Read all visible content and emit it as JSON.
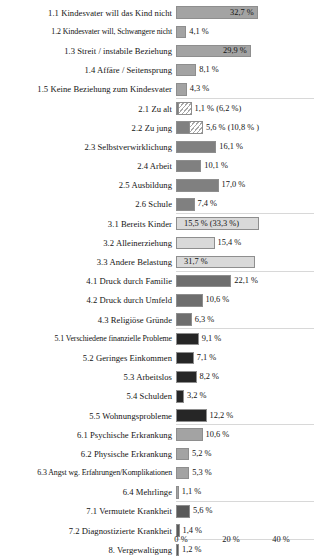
{
  "chart_data": {
    "type": "bar",
    "orientation": "horizontal",
    "title": "",
    "subtitle": "",
    "xlabel": "",
    "ylabel": "",
    "xlim": [
      0,
      44
    ],
    "grid": false,
    "legend": null,
    "axis": {
      "ticks": [
        {
          "value": 0,
          "label": "0 %"
        },
        {
          "value": 20,
          "label": "20 %"
        },
        {
          "value": 40,
          "label": "40 %"
        }
      ],
      "unit": "%"
    },
    "note": "Bars 2.1 and 2.2 show a solid primary value plus a hatched extension; value labels in parentheses give the extended total. Bar 3.1 shows the extended total 33,3 % as the drawn bar length.",
    "categories": [
      "1.1 Kindesvater will das Kind nicht",
      "1.2 Kindesvater will, Schwangere nicht",
      "1.3 Streit / instabile Beziehung",
      "1.4 Affäre / Seitensprung",
      "1.5 Keine Beziehung zum Kindesvater",
      "2.1 Zu alt",
      "2.2 Zu jung",
      "2.3 Selbstverwirklichung",
      "2.4 Arbeit",
      "2.5 Ausbildung",
      "2.6 Schule",
      "3.1 Bereits Kinder",
      "3.2 Alleinerziehung",
      "3.3 Andere Belastung",
      "4.1 Druck durch Familie",
      "4.2 Druck durch Umfeld",
      "4.3 Religiöse Gründe",
      "5.1 Verschiedene finanzielle Probleme",
      "5.2 Geringes Einkommen",
      "5.3 Arbeitslos",
      "5.4 Schulden",
      "5.5 Wohnungsprobleme",
      "6.1 Psychische Erkrankung",
      "6.2 Physische Erkrankung",
      "6.3 Angst wg. Erfahrungen/Komplikationen",
      "6.4 Mehrlinge",
      "7.1 Vermutete Krankheit",
      "7.2 Diagnostizierte Krankheit",
      "8. Vergewaltigung"
    ],
    "values": [
      32.7,
      4.1,
      29.9,
      8.1,
      4.3,
      1.1,
      5.6,
      16.1,
      10.1,
      17.0,
      7.4,
      15.5,
      15.4,
      31.7,
      22.1,
      10.6,
      6.3,
      9.1,
      7.1,
      8.2,
      3.2,
      12.2,
      10.6,
      5.2,
      5.3,
      1.1,
      5.6,
      1.4,
      1.2
    ],
    "values_extended": [
      null,
      null,
      null,
      null,
      null,
      6.2,
      10.8,
      null,
      null,
      null,
      null,
      33.3,
      null,
      null,
      null,
      null,
      null,
      null,
      null,
      null,
      null,
      null,
      null,
      null,
      null,
      null,
      null,
      null,
      null
    ]
  },
  "colors": {
    "group1": "#a3a3a3",
    "group2": "#808080",
    "group3": "#d9d9d9",
    "group4": "#6e6e6e",
    "group5": "#262626",
    "group6": "#a3a3a3",
    "group7": "#595959",
    "group8": "#595959",
    "hatch_line": "#a8a8a8",
    "bar_border": "#8e8e8e",
    "separator": "#d8d8d8",
    "text": "#141414",
    "background": "#ffffff"
  },
  "rows": [
    {
      "label": "1.1 Kindesvater will das Kind nicht",
      "value": 32.7,
      "value_label": "32,7 %",
      "color_key": "group1",
      "label_inside": true,
      "hatch_to": null,
      "tiny": false
    },
    {
      "label": "1.2 Kindesvater will, Schwangere nicht",
      "value": 4.1,
      "value_label": "4,1 %",
      "color_key": "group1",
      "label_inside": false,
      "hatch_to": null,
      "tiny": true
    },
    {
      "label": "1.3 Streit / instabile Beziehung",
      "value": 29.9,
      "value_label": "29,9 %",
      "color_key": "group1",
      "label_inside": true,
      "hatch_to": null,
      "tiny": false
    },
    {
      "label": "1.4 Affäre / Seitensprung",
      "value": 8.1,
      "value_label": "8,1 %",
      "color_key": "group1",
      "label_inside": false,
      "hatch_to": null,
      "tiny": false
    },
    {
      "label": "1.5 Keine Beziehung zum Kindesvater",
      "value": 4.3,
      "value_label": "4,3 %",
      "color_key": "group1",
      "label_inside": false,
      "hatch_to": null,
      "tiny": false,
      "separator_after": true
    },
    {
      "label": "2.1 Zu alt",
      "value": 1.1,
      "value_label": "1,1 % (6,2 %)",
      "color_key": "group2",
      "label_inside": false,
      "hatch_to": 6.2,
      "tiny": false
    },
    {
      "label": "2.2 Zu jung",
      "value": 5.6,
      "value_label": "5,6 % (10,8 % )",
      "color_key": "group2",
      "label_inside": false,
      "hatch_to": 10.8,
      "tiny": false
    },
    {
      "label": "2.3 Selbstverwirklichung",
      "value": 16.1,
      "value_label": "16,1 %",
      "color_key": "group2",
      "label_inside": false,
      "hatch_to": null,
      "tiny": false
    },
    {
      "label": "2.4 Arbeit",
      "value": 10.1,
      "value_label": "10,1 %",
      "color_key": "group2",
      "label_inside": false,
      "hatch_to": null,
      "tiny": false
    },
    {
      "label": "2.5 Ausbildung",
      "value": 17.0,
      "value_label": "17,0 %",
      "color_key": "group2",
      "label_inside": false,
      "hatch_to": null,
      "tiny": false
    },
    {
      "label": "2.6 Schule",
      "value": 7.4,
      "value_label": "7,4 %",
      "color_key": "group2",
      "label_inside": false,
      "hatch_to": null,
      "tiny": false,
      "separator_after": true
    },
    {
      "label": "3.1 Bereits Kinder",
      "value": 33.3,
      "value_label": "15,5 % (33,3 %)",
      "color_key": "group3",
      "label_inside": true,
      "hatch_to": null,
      "tiny": false
    },
    {
      "label": "3.2 Alleinerziehung",
      "value": 15.4,
      "value_label": "15,4 %",
      "color_key": "group3",
      "label_inside": false,
      "hatch_to": null,
      "tiny": false
    },
    {
      "label": "3.3 Andere Belastung",
      "value": 31.7,
      "value_label": "31,7 %",
      "color_key": "group3",
      "label_inside": true,
      "hatch_to": null,
      "tiny": false,
      "separator_after": true
    },
    {
      "label": "4.1 Druck durch Familie",
      "value": 22.1,
      "value_label": "22,1 %",
      "color_key": "group4",
      "label_inside": false,
      "hatch_to": null,
      "tiny": false
    },
    {
      "label": "4.2 Druck durch Umfeld",
      "value": 10.6,
      "value_label": "10,6 %",
      "color_key": "group4",
      "label_inside": false,
      "hatch_to": null,
      "tiny": false
    },
    {
      "label": "4.3 Religiöse Gründe",
      "value": 6.3,
      "value_label": "6,3 %",
      "color_key": "group4",
      "label_inside": false,
      "hatch_to": null,
      "tiny": false,
      "separator_after": true
    },
    {
      "label": "5.1 Verschiedene finanzielle Probleme",
      "value": 9.1,
      "value_label": "9,1 %",
      "color_key": "group5",
      "label_inside": false,
      "hatch_to": null,
      "tiny": true
    },
    {
      "label": "5.2 Geringes Einkommen",
      "value": 7.1,
      "value_label": "7,1 %",
      "color_key": "group5",
      "label_inside": false,
      "hatch_to": null,
      "tiny": false
    },
    {
      "label": "5.3 Arbeitslos",
      "value": 8.2,
      "value_label": "8,2 %",
      "color_key": "group5",
      "label_inside": false,
      "hatch_to": null,
      "tiny": false
    },
    {
      "label": "5.4 Schulden",
      "value": 3.2,
      "value_label": "3,2 %",
      "color_key": "group5",
      "label_inside": false,
      "hatch_to": null,
      "tiny": false
    },
    {
      "label": "5.5 Wohnungsprobleme",
      "value": 12.2,
      "value_label": "12,2 %",
      "color_key": "group5",
      "label_inside": false,
      "hatch_to": null,
      "tiny": false,
      "separator_after": true
    },
    {
      "label": "6.1 Psychische Erkrankung",
      "value": 10.6,
      "value_label": "10,6 %",
      "color_key": "group6",
      "label_inside": false,
      "hatch_to": null,
      "tiny": false
    },
    {
      "label": "6.2 Physische Erkrankung",
      "value": 5.2,
      "value_label": "5,2 %",
      "color_key": "group6",
      "label_inside": false,
      "hatch_to": null,
      "tiny": false
    },
    {
      "label": "6.3 Angst wg. Erfahrungen/Komplikationen",
      "value": 5.3,
      "value_label": "5,3 %",
      "color_key": "group6",
      "label_inside": false,
      "hatch_to": null,
      "tiny": true
    },
    {
      "label": "6.4 Mehrlinge",
      "value": 1.1,
      "value_label": "1,1 %",
      "color_key": "group6",
      "label_inside": false,
      "hatch_to": null,
      "tiny": false,
      "separator_after": true
    },
    {
      "label": "7.1 Vermutete Krankheit",
      "value": 5.6,
      "value_label": "5,6 %",
      "color_key": "group7",
      "label_inside": false,
      "hatch_to": null,
      "tiny": false
    },
    {
      "label": "7.2 Diagnostizierte Krankheit",
      "value": 1.4,
      "value_label": "1,4 %",
      "color_key": "group7",
      "label_inside": false,
      "hatch_to": null,
      "tiny": false,
      "separator_after": true
    },
    {
      "label": "8. Vergewaltigung",
      "value": 1.2,
      "value_label": "1,2 %",
      "color_key": "group8",
      "label_inside": false,
      "hatch_to": null,
      "tiny": false
    }
  ]
}
